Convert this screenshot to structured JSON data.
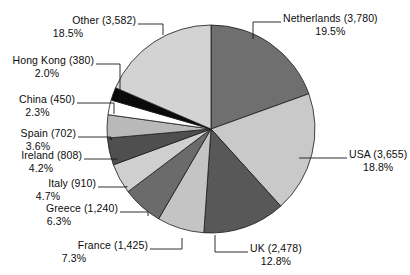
{
  "chart_data": {
    "type": "pie",
    "title": "",
    "xlabel": "",
    "ylabel": "",
    "legend_position": "callout-labels",
    "grid": false,
    "total": 19410,
    "categories": [
      "Netherlands",
      "USA",
      "UK",
      "France",
      "Greece",
      "Italy",
      "Ireland",
      "Spain",
      "China",
      "Hong Kong",
      "Other"
    ],
    "values": [
      3780,
      3655,
      2478,
      1425,
      1240,
      910,
      808,
      702,
      450,
      380,
      3582
    ],
    "percentages": [
      19.5,
      18.8,
      12.8,
      7.3,
      6.3,
      4.7,
      4.2,
      3.6,
      2.3,
      2.0,
      18.5
    ],
    "colors": [
      "#6f6f6f",
      "#c9c9c9",
      "#585858",
      "#c4c4c4",
      "#6b6b6b",
      "#cfcfcf",
      "#4f4f4f",
      "#b9b9b9",
      "#8a8a8a",
      "#ffffff",
      "#0a0a0a"
    ],
    "slices": [
      {
        "name": "Netherlands",
        "value": "3,780",
        "percent": "19.5%",
        "label_line1": "Netherlands (3,780)",
        "label_line2": "19.5%",
        "color": "#6f6f6f",
        "side": "right"
      },
      {
        "name": "USA",
        "value": "3,655",
        "percent": "18.8%",
        "label_line1": "USA (3,655)",
        "label_line2": "18.8%",
        "color": "#c9c9c9",
        "side": "right"
      },
      {
        "name": "UK",
        "value": "2,478",
        "percent": "12.8%",
        "label_line1": "UK (2,478)",
        "label_line2": "12.8%",
        "color": "#585858",
        "side": "right"
      },
      {
        "name": "France",
        "value": "1,425",
        "percent": "7.3%",
        "label_line1": "France (1,425)",
        "label_line2": "7.3%",
        "color": "#c4c4c4",
        "side": "left"
      },
      {
        "name": "Greece",
        "value": "1,240",
        "percent": "6.3%",
        "label_line1": "Greece (1,240)",
        "label_line2": "6.3%",
        "color": "#6b6b6b",
        "side": "left"
      },
      {
        "name": "Italy",
        "value": "910",
        "percent": "4.7%",
        "label_line1": "Italy (910)",
        "label_line2": "4.7%",
        "color": "#cfcfcf",
        "side": "left"
      },
      {
        "name": "Ireland",
        "value": "808",
        "percent": "4.2%",
        "label_line1": "Ireland (808)",
        "label_line2": "4.2%",
        "color": "#4f4f4f",
        "side": "left"
      },
      {
        "name": "Spain",
        "value": "702",
        "percent": "3.6%",
        "label_line1": "Spain (702)",
        "label_line2": "3.6%",
        "color": "#b9b9b9",
        "side": "left"
      },
      {
        "name": "China",
        "value": "450",
        "percent": "2.3%",
        "label_line1": "China (450)",
        "label_line2": "2.3%",
        "color": "#ffffff",
        "side": "left"
      },
      {
        "name": "Hong Kong",
        "value": "380",
        "percent": "2.0%",
        "label_line1": "Hong Kong (380)",
        "label_line2": "2.0%",
        "color": "#0a0a0a",
        "side": "left"
      },
      {
        "name": "Other",
        "value": "3,582",
        "percent": "18.5%",
        "label_line1": "Other (3,582)",
        "label_line2": "18.5%",
        "color": "#d3d3d3",
        "side": "left"
      }
    ]
  },
  "labels": {
    "netherlands_l1": "Netherlands (3,780)",
    "netherlands_l2": "19.5%",
    "usa_l1": "USA (3,655)",
    "usa_l2": "18.8%",
    "uk_l1": "UK (2,478)",
    "uk_l2": "12.8%",
    "france_l1": "France (1,425)",
    "france_l2": "7.3%",
    "greece_l1": "Greece (1,240)",
    "greece_l2": "6.3%",
    "italy_l1": "Italy (910)",
    "italy_l2": "4.7%",
    "ireland_l1": "Ireland (808)",
    "ireland_l2": "4.2%",
    "spain_l1": "Spain (702)",
    "spain_l2": "3.6%",
    "china_l1": "China (450)",
    "china_l2": "2.3%",
    "hongkong_l1": "Hong Kong (380)",
    "hongkong_l2": "2.0%",
    "other_l1": "Other (3,582)",
    "other_l2": "18.5%"
  }
}
